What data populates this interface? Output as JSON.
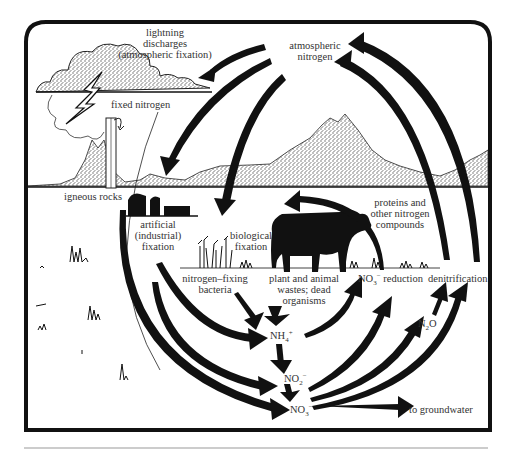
{
  "diagram": {
    "colors": {
      "ink": "#111111",
      "stipple": "#9a9a9a",
      "text": "#333333",
      "rule": "#999999",
      "background": "#ffffff"
    },
    "labels": {
      "lightning": [
        "lightning",
        "discharges",
        "(atmospheric fixation)"
      ],
      "atmospheric_nitrogen": [
        "atmospheric",
        "nitrogen"
      ],
      "fixed_nitrogen": "fixed nitrogen",
      "igneous_rocks": "igneous rocks",
      "artificial_fixation": [
        "artificial",
        "(industrial)",
        "fixation"
      ],
      "biological_fixation": [
        "biological",
        "fixation"
      ],
      "proteins": [
        "proteins and",
        "other nitrogen",
        "compounds"
      ],
      "nitrogen_fixing_bacteria": [
        "nitrogen–fixing",
        "bacteria"
      ],
      "wastes": [
        "plant and animal",
        "wastes; dead",
        "organisms"
      ],
      "no3_reduction": {
        "base": "NO",
        "sub": "3",
        "sup": "−",
        "text": " reduction"
      },
      "denitrification": "denitrification",
      "nh4": {
        "base": "NH",
        "sub": "4",
        "sup": "+"
      },
      "no2": {
        "base": "NO",
        "sub": "2",
        "sup": "−"
      },
      "no3": {
        "base": "NO",
        "sub": "3",
        "sup": "−"
      },
      "n2o": {
        "base": "N",
        "sub": "2",
        "tail": "O"
      },
      "groundwater": "to groundwater"
    },
    "nodes": [
      "atmospheric nitrogen",
      "lightning discharges",
      "artificial (industrial) fixation",
      "biological fixation",
      "nitrogen-fixing bacteria",
      "plant and animal wastes; dead organisms",
      "NH4+",
      "NO2-",
      "NO3-",
      "NO3- reduction",
      "denitrification",
      "N2O",
      "proteins and other nitrogen compounds",
      "to groundwater"
    ],
    "edges": [
      [
        "atmospheric nitrogen",
        "lightning discharges"
      ],
      [
        "atmospheric nitrogen",
        "artificial (industrial) fixation"
      ],
      [
        "atmospheric nitrogen",
        "biological fixation"
      ],
      [
        "NO3- reduction",
        "atmospheric nitrogen"
      ],
      [
        "denitrification",
        "atmospheric nitrogen"
      ],
      [
        "proteins and other nitrogen compounds",
        "plant and animal wastes; dead organisms"
      ],
      [
        "nitrogen-fixing bacteria",
        "NH4+"
      ],
      [
        "plant and animal wastes; dead organisms",
        "NH4+"
      ],
      [
        "NH4+",
        "NO2-"
      ],
      [
        "NO2-",
        "NO3-"
      ],
      [
        "artificial (industrial) fixation",
        "NH4+"
      ],
      [
        "artificial (industrial) fixation",
        "NO2-"
      ],
      [
        "fixed nitrogen",
        "NO3-"
      ],
      [
        "NH4+",
        "NO3- reduction"
      ],
      [
        "NO3-",
        "NO3- reduction"
      ],
      [
        "NO3-",
        "N2O"
      ],
      [
        "NO3-",
        "denitrification"
      ],
      [
        "NO3-",
        "to groundwater"
      ]
    ]
  }
}
